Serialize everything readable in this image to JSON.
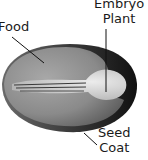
{
  "diagram": {
    "labels": {
      "food": "Food",
      "embryo_line1": "Embryo",
      "embryo_line2": "Plant",
      "seed_line1": "Seed",
      "seed_line2": "Coat"
    },
    "colors": {
      "seed_coat": "#1c1c1c",
      "food": "#8a8a8a",
      "embryo": "#d8d8d8",
      "text": "#1a1a1a"
    }
  }
}
